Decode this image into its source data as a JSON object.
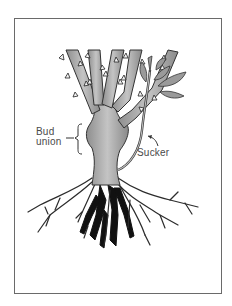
{
  "figure": {
    "labels": {
      "bud_union_line1": "Bud",
      "bud_union_line2": "union",
      "sucker": "Sucker"
    },
    "colors": {
      "frame": "#6a6a6a",
      "stem_fill": "#a9a9a9",
      "stem_stroke": "#3a3a3a",
      "root_dark": "#111111",
      "label_text": "#4a4a4a",
      "background": "#ffffff"
    }
  }
}
